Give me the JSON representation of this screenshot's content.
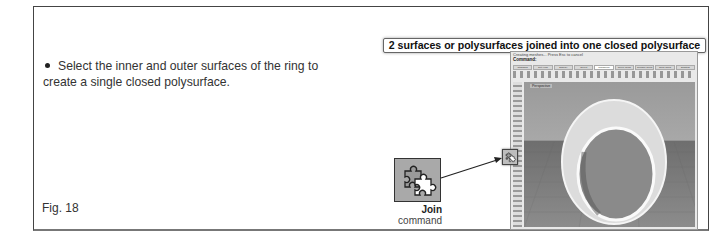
{
  "instruction": {
    "text": "Select the inner and outer surfaces of the ring to create a single closed polysurface."
  },
  "figure_label": "Fig. 18",
  "banner": "2 surfaces or polysurfaces joined into one closed polysurface",
  "rhino_screenshot": {
    "status_line": "Creating meshes... Press Esc to cancel",
    "command_prompt": "Command:",
    "tabs": [
      "Standard",
      "Set View",
      "Display",
      "Select",
      "Transform",
      "Curve Tools",
      "Surface Tools",
      "Solid Tools",
      "Drafting"
    ],
    "active_tab": "Transform",
    "viewport_label": "Perspective"
  },
  "join_callout": {
    "icon": "join-puzzle-icon",
    "title": "Join",
    "subtitle": "command"
  }
}
